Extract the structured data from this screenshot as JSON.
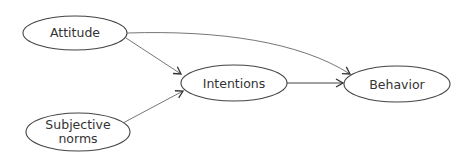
{
  "diagram": {
    "nodes": [
      {
        "id": "attitude",
        "label": "Attitude",
        "cx": 75,
        "cy": 33,
        "rx": 52,
        "ry": 17
      },
      {
        "id": "subjective_norms",
        "label": "Subjective\nnorms",
        "cx": 78,
        "cy": 132,
        "rx": 52,
        "ry": 19
      },
      {
        "id": "intentions",
        "label": "Intentions",
        "cx": 234,
        "cy": 83,
        "rx": 53,
        "ry": 18
      },
      {
        "id": "behavior",
        "label": "Behavior",
        "cx": 397,
        "cy": 84,
        "rx": 53,
        "ry": 18
      }
    ],
    "edges": [
      {
        "from": "attitude",
        "to": "intentions"
      },
      {
        "from": "subjective_norms",
        "to": "intentions"
      },
      {
        "from": "intentions",
        "to": "behavior"
      },
      {
        "from": "attitude",
        "to": "behavior",
        "curved": true
      }
    ],
    "colors": {
      "stroke": "#444444",
      "text": "#333333",
      "background": "#ffffff"
    }
  }
}
